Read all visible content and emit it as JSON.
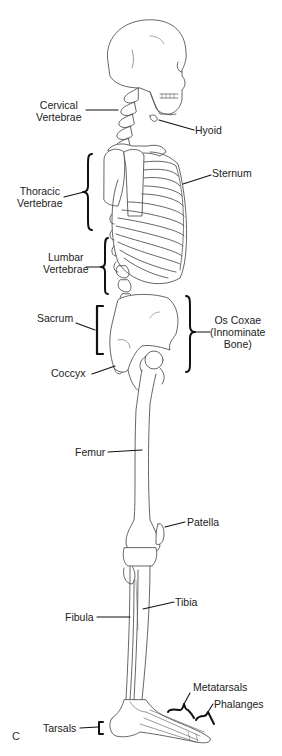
{
  "diagram": {
    "panel_letter": "C",
    "colors": {
      "bone_outline": "#555555",
      "leader_line": "#111111",
      "text": "#222222",
      "background": "#ffffff"
    }
  },
  "labels": {
    "cervical_vertebrae": {
      "line1": "Cervical",
      "line2": "Vertebrae"
    },
    "hyoid": "Hyoid",
    "thoracic_vertebrae": {
      "line1": "Thoracic",
      "line2": "Vertebrae"
    },
    "sternum": "Sternum",
    "lumbar_vertebrae": {
      "line1": "Lumbar",
      "line2": "Vertebrae"
    },
    "sacrum": "Sacrum",
    "os_coxae": {
      "line1": "Os Coxae",
      "line2": "(Innominate",
      "line3": "Bone)"
    },
    "coccyx": "Coccyx",
    "femur": "Femur",
    "patella": "Patella",
    "tibia": "Tibia",
    "fibula": "Fibula",
    "metatarsals": "Metatarsals",
    "phalanges": "Phalanges",
    "tarsals": "Tarsals"
  }
}
